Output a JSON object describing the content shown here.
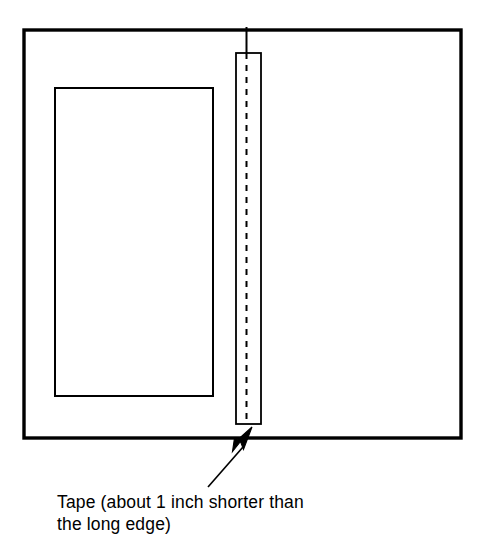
{
  "figure": {
    "kind": "line-art-instructional-diagram",
    "background_color": "#ffffff",
    "ink_color": "#000000",
    "outer_panel": {
      "name": "sheet-outline",
      "x": 24,
      "y": 30,
      "width": 437,
      "height": 408,
      "stroke_width": 3.4
    },
    "inner_panel": {
      "name": "inset-panel-outline",
      "x": 55,
      "y": 88,
      "width": 158,
      "height": 308,
      "stroke_width": 2.0
    },
    "tape_strip": {
      "name": "tape-strip",
      "x": 236,
      "y": 53,
      "width": 25,
      "height": 371,
      "stroke_width": 1.8
    },
    "fold_line": {
      "name": "dashed-fold-line",
      "x": 246.5,
      "y_top": 27,
      "y_bottom": 421,
      "dash": "6 6",
      "stroke_width": 2.0
    },
    "callout": {
      "arrow_tip_x": 252,
      "arrow_tip_y": 427,
      "leader_start_x": 208,
      "leader_start_y": 487,
      "leader_end_x": 243,
      "leader_end_y": 447,
      "stroke_width": 1.6
    }
  },
  "caption": {
    "line_1": "Tape (about 1 inch shorter than",
    "line_2": "the long edge)",
    "full_text": "Tape (about 1 inch shorter than the long edge)"
  }
}
